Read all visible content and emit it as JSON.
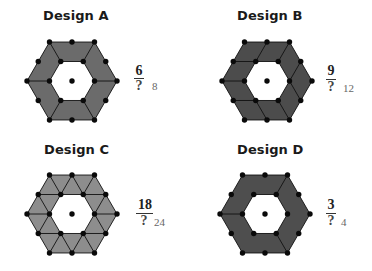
{
  "colors": {
    "stroke": "#111111",
    "dot": "#0a0a0a",
    "background": "#ffffff"
  },
  "designs": [
    {
      "id": "A",
      "title": "Design A",
      "fill": "#6b6b6b",
      "fraction": {
        "numerator": "6",
        "denominator": "?",
        "answer": "8"
      },
      "pieces": 6,
      "partition_lines": [
        [
          "O0",
          "I0"
        ],
        [
          "O1",
          "I1"
        ],
        [
          "O2",
          "I2"
        ],
        [
          "O3",
          "I3"
        ],
        [
          "O4",
          "I4"
        ],
        [
          "O5",
          "I5"
        ]
      ]
    },
    {
      "id": "B",
      "title": "Design B",
      "fill": "#4c4c4c",
      "fraction": {
        "numerator": "9",
        "denominator": "?",
        "answer": "12"
      },
      "pieces": 12,
      "partition_lines": [
        [
          "M4",
          "I4"
        ],
        [
          "O5",
          "I5"
        ],
        [
          "M5",
          "I0"
        ],
        [
          "M0",
          "I0"
        ],
        [
          "O1",
          "I1"
        ],
        [
          "M1",
          "I2"
        ],
        [
          "M2",
          "I2"
        ],
        [
          "O3",
          "I3"
        ],
        [
          "M3",
          "I4"
        ]
      ]
    },
    {
      "id": "C",
      "title": "Design C",
      "fill": "#8d8d8d",
      "fraction": {
        "numerator": "18",
        "denominator": "?",
        "answer": "24"
      },
      "pieces": 18,
      "partition_lines": [
        [
          "O0",
          "I0"
        ],
        [
          "O1",
          "I1"
        ],
        [
          "O2",
          "I2"
        ],
        [
          "O3",
          "I3"
        ],
        [
          "O4",
          "I4"
        ],
        [
          "O5",
          "I5"
        ],
        [
          "M0",
          "I0"
        ],
        [
          "M0",
          "I1"
        ],
        [
          "M1",
          "I1"
        ],
        [
          "M1",
          "I2"
        ],
        [
          "M2",
          "I2"
        ],
        [
          "M2",
          "I3"
        ],
        [
          "M3",
          "I3"
        ],
        [
          "M3",
          "I4"
        ],
        [
          "M4",
          "I4"
        ],
        [
          "M4",
          "I5"
        ],
        [
          "M5",
          "I5"
        ],
        [
          "M5",
          "I0"
        ]
      ]
    },
    {
      "id": "D",
      "title": "Design D",
      "fill": "#4e4e4e",
      "fraction": {
        "numerator": "3",
        "denominator": "?",
        "answer": "4"
      },
      "pieces": 3,
      "partition_lines": [
        [
          "O5",
          "I5"
        ],
        [
          "O1",
          "I1"
        ],
        [
          "O3",
          "I3"
        ]
      ]
    }
  ]
}
